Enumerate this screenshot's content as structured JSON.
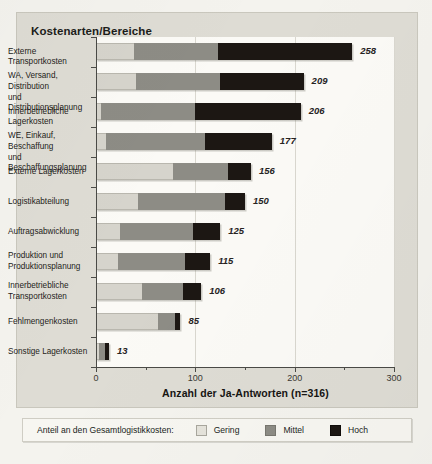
{
  "chart_data": {
    "type": "bar",
    "orientation": "horizontal",
    "stacked": true,
    "title": "Kostenarten/Bereiche",
    "xlabel": "Anzahl der Ja-Antworten (n=316)",
    "ylabel": "",
    "xlim": [
      0,
      300
    ],
    "xticks": [
      0,
      100,
      200,
      300
    ],
    "xtick_labels": [
      "0",
      "100",
      "200",
      "300"
    ],
    "grid": true,
    "grid_axis": "x",
    "legend_position": "bottom",
    "legend_title": "Anteil an den Gesamtlogistikkosten:",
    "series": [
      {
        "name": "Gering",
        "color": "#d6d4cc",
        "values": [
          38,
          40,
          5,
          10,
          78,
          42,
          24,
          22,
          46,
          62,
          3
        ]
      },
      {
        "name": "Mittel",
        "color": "#8d8c85",
        "values": [
          85,
          85,
          95,
          100,
          55,
          88,
          74,
          68,
          42,
          18,
          6
        ]
      },
      {
        "name": "Hoch",
        "color": "#1c1713",
        "values": [
          135,
          84,
          106,
          67,
          23,
          20,
          27,
          25,
          18,
          5,
          4
        ]
      }
    ],
    "categories": [
      "Externe Transportkosten",
      "WA, Versand, Distribution und Distributionsplanung",
      "Innerbetriebliche Lagerkosten",
      "WE, Einkauf, Beschaffung und Beschaffungsplanung",
      "Externe Lagerkosten",
      "Logistikabteilung",
      "Auftragsabwicklung",
      "Produktion und Produktionsplanung",
      "Innerbetriebliche Transportkosten",
      "Fehlmengenkosten",
      "Sonstige Lagerkosten"
    ],
    "totals": [
      258,
      209,
      206,
      177,
      156,
      150,
      125,
      115,
      106,
      85,
      13
    ],
    "total_labels": [
      "258",
      "209",
      "206",
      "177",
      "156",
      "150",
      "125",
      "115",
      "106",
      "85",
      "13"
    ]
  },
  "category_lines": [
    [
      "Externe Transportkosten"
    ],
    [
      "WA, Versand, Distribution",
      "und Distributionsplanung"
    ],
    [
      "Innerbetriebliche Lagerkosten"
    ],
    [
      "WE, Einkauf, Beschaffung",
      "und Beschaffungsplanung"
    ],
    [
      "Externe Lagerkosten"
    ],
    [
      "Logistikabteilung"
    ],
    [
      "Auftragsabwicklung"
    ],
    [
      "Produktion und",
      "Produktionsplanung"
    ],
    [
      "Innerbetriebliche",
      "Transportkosten"
    ],
    [
      "Fehlmengenkosten"
    ],
    [
      "Sonstige Lagerkosten"
    ]
  ],
  "legend": {
    "title": "Anteil an den Gesamtlogistikkosten:",
    "items": [
      {
        "label": "Gering",
        "key": "low"
      },
      {
        "label": "Mittel",
        "key": "mid"
      },
      {
        "label": "Hoch",
        "key": "high"
      }
    ]
  },
  "colors": {
    "panel_bg": "#dedcd4",
    "plot_bg": "#fbfaf6",
    "axis": "#4a4a46",
    "grid": "#d9d7cf",
    "low": "#d6d4cc",
    "mid": "#8d8c85",
    "high": "#1c1713"
  }
}
